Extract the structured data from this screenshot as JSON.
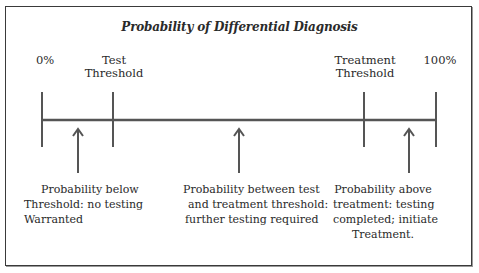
{
  "diagram": {
    "title": "Probability of Differential Diagnosis",
    "axis_labels": [
      {
        "line1": "0%",
        "line2": ""
      },
      {
        "line1": "Test",
        "line2": "Threshold"
      },
      {
        "line1": "Treatment",
        "line2": "Threshold"
      },
      {
        "line1": "100%",
        "line2": ""
      }
    ],
    "regions": [
      {
        "line1": "Probability below",
        "line2": "Threshold: no testing",
        "line3": "Warranted"
      },
      {
        "line1": "Probability between test",
        "line2": "and treatment threshold:",
        "line3": "further testing required"
      },
      {
        "line1": "Probability above",
        "line2": "treatment: testing",
        "line3": "completed; initiate",
        "line4": "Treatment."
      }
    ],
    "colors": {
      "line": "#555555",
      "border": "#3a3a3a",
      "text": "#2a2a2a"
    }
  }
}
